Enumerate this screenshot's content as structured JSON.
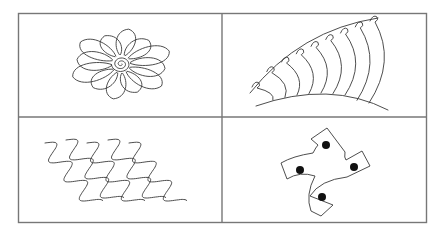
{
  "figure": {
    "panels": [
      {
        "id": "flower",
        "label": "Daisy flower with spiral center",
        "petal_count": 12
      },
      {
        "id": "loop-fan",
        "label": "Fan of arched lines with loops along the top edge",
        "arc_count": 9
      },
      {
        "id": "waves",
        "label": "Diagonal wavy lines",
        "line_count": 5
      },
      {
        "id": "pinwheel",
        "label": "Four-armed pinwheel shape with dots",
        "dot_count": 4
      }
    ],
    "colors": {
      "frame": "#777777",
      "ink": "#3a3a3a",
      "dot": "#111111",
      "background": "#ffffff"
    }
  }
}
